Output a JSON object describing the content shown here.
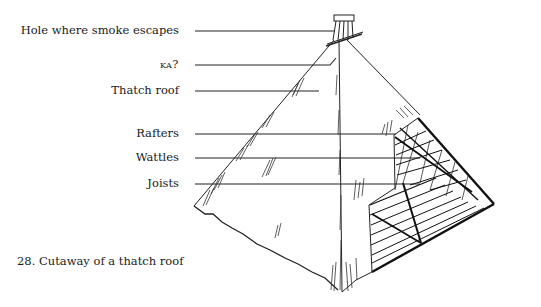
{
  "figure": {
    "caption": "28. Cutaway of a thatch roof",
    "labels": [
      {
        "id": "smoke-hole",
        "text": "Hole where smoke escapes"
      },
      {
        "id": "ka",
        "text": "ka?"
      },
      {
        "id": "thatch-roof",
        "text": "Thatch roof"
      },
      {
        "id": "rafters",
        "text": "Rafters"
      },
      {
        "id": "wattles",
        "text": "Wattles"
      },
      {
        "id": "joists",
        "text": "Joists"
      }
    ]
  }
}
